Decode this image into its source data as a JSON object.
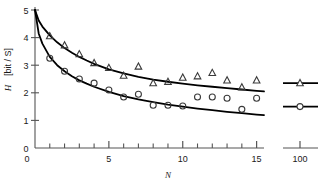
{
  "chart_data": {
    "type": "scatter",
    "title": "",
    "xlabel": "N",
    "ylabel": "H",
    "ylabel_unit": "[bit / S]",
    "xlim": [
      0,
      15.5
    ],
    "ylim": [
      0,
      5
    ],
    "grid": false,
    "legend_position": "none",
    "xticks_major": [
      0,
      5,
      10,
      15
    ],
    "xticks_major_labels": [
      "0",
      "5",
      "10",
      "15"
    ],
    "xticks_minor": [
      1,
      2,
      3,
      4,
      6,
      7,
      8,
      9,
      11,
      12,
      13,
      14
    ],
    "yticks": [
      0,
      1,
      2,
      3,
      4,
      5
    ],
    "ytick_labels": [
      "0",
      "1",
      "2",
      "3",
      "4",
      "5"
    ],
    "broken_axis": {
      "label": "100",
      "tick_value": 100
    },
    "series": [
      {
        "name": "upper",
        "marker": "triangle",
        "x": [
          1,
          2,
          3,
          4,
          5,
          6,
          7,
          8,
          9,
          10,
          11,
          12,
          13,
          14,
          15
        ],
        "y": [
          4.05,
          3.72,
          3.4,
          3.08,
          2.9,
          2.62,
          2.95,
          2.35,
          2.4,
          2.55,
          2.6,
          2.72,
          2.45,
          2.2,
          2.45
        ],
        "isolated_point": {
          "x": 100,
          "y": 2.35
        }
      },
      {
        "name": "lower",
        "marker": "circle",
        "x": [
          1,
          2,
          3,
          4,
          5,
          6,
          7,
          8,
          9,
          10,
          11,
          12,
          13,
          14,
          15
        ],
        "y": [
          3.25,
          2.78,
          2.5,
          2.35,
          2.1,
          1.85,
          1.95,
          1.55,
          1.55,
          1.52,
          1.85,
          1.85,
          1.8,
          1.4,
          1.8
        ],
        "isolated_point": {
          "x": 100,
          "y": 1.5
        }
      }
    ],
    "fit_curves": [
      {
        "name": "upper-fit",
        "points_x": [
          0,
          0.25,
          0.5,
          1,
          1.5,
          2,
          2.5,
          3,
          3.5,
          4,
          5,
          6,
          7,
          8,
          9,
          10,
          11,
          12,
          13,
          14,
          15,
          15.5
        ],
        "points_y": [
          5.0,
          4.62,
          4.4,
          4.08,
          3.83,
          3.62,
          3.45,
          3.3,
          3.17,
          3.05,
          2.85,
          2.7,
          2.58,
          2.48,
          2.4,
          2.33,
          2.27,
          2.22,
          2.17,
          2.12,
          2.07,
          2.05
        ]
      },
      {
        "name": "lower-fit",
        "points_x": [
          0,
          0.25,
          0.5,
          1,
          1.5,
          2,
          2.5,
          3,
          3.5,
          4,
          5,
          6,
          7,
          8,
          9,
          10,
          11,
          12,
          13,
          14,
          15,
          15.5
        ],
        "points_y": [
          5.0,
          4.15,
          3.78,
          3.3,
          3.0,
          2.78,
          2.6,
          2.45,
          2.33,
          2.22,
          2.03,
          1.88,
          1.76,
          1.66,
          1.57,
          1.5,
          1.43,
          1.37,
          1.31,
          1.26,
          1.21,
          1.19
        ]
      }
    ]
  },
  "axis": {
    "y_label": "H",
    "y_unit": "[bit / S]",
    "x_label": "N",
    "x_tick_0": "0",
    "x_tick_5": "5",
    "x_tick_10": "10",
    "x_tick_15": "15",
    "x_tick_100": "100",
    "y_tick_0": "0",
    "y_tick_1": "1",
    "y_tick_2": "2",
    "y_tick_3": "3",
    "y_tick_4": "4",
    "y_tick_5": "5"
  },
  "colors": {
    "axis": "#555555",
    "curve": "#000000",
    "marker": "#3a3a3a",
    "text": "#1a1a1a",
    "background": "#ffffff"
  }
}
